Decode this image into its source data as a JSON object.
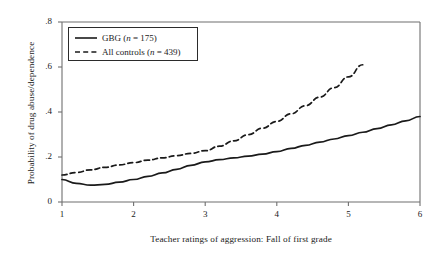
{
  "chart_data": {
    "type": "line",
    "title": "",
    "xlabel": "Teacher ratings of aggression: Fall of first grade",
    "ylabel": "Probability of drug abuse/dependence",
    "xlim": [
      1,
      6
    ],
    "ylim": [
      0,
      0.8
    ],
    "xticks": [
      "1",
      "2",
      "3",
      "4",
      "5",
      "6"
    ],
    "xtick_values": [
      1,
      2,
      3,
      4,
      5,
      6
    ],
    "yticks": [
      "0",
      ".2",
      ".4",
      ".6",
      ".8"
    ],
    "ytick_values": [
      0,
      0.2,
      0.4,
      0.6,
      0.8
    ],
    "grid": false,
    "legend_position": "upper-left",
    "series": [
      {
        "name": "GBG (n = 175)",
        "label_prefix": "GBG (",
        "label_italic": "n",
        "label_suffix": " = 175)",
        "style": "solid",
        "color": "#1a1a1a",
        "x": [
          1.0,
          1.2,
          1.4,
          1.6,
          1.8,
          2.0,
          2.2,
          2.4,
          2.6,
          2.8,
          3.0,
          3.2,
          3.4,
          3.6,
          3.8,
          4.0,
          4.2,
          4.4,
          4.6,
          4.8,
          5.0,
          5.2,
          5.4,
          5.6,
          5.8,
          6.0
        ],
        "y": [
          0.1,
          0.083,
          0.075,
          0.078,
          0.088,
          0.1,
          0.114,
          0.129,
          0.145,
          0.163,
          0.178,
          0.188,
          0.196,
          0.204,
          0.213,
          0.224,
          0.238,
          0.252,
          0.266,
          0.28,
          0.295,
          0.31,
          0.326,
          0.343,
          0.361,
          0.38
        ]
      },
      {
        "name": "All controls (n = 439)",
        "label_prefix": "All controls (",
        "label_italic": "n",
        "label_suffix": " = 439)",
        "style": "dashed",
        "color": "#1a1a1a",
        "x": [
          1.0,
          1.2,
          1.4,
          1.6,
          1.8,
          2.0,
          2.2,
          2.4,
          2.6,
          2.8,
          3.0,
          3.2,
          3.4,
          3.6,
          3.8,
          4.0,
          4.2,
          4.4,
          4.6,
          4.8,
          5.0,
          5.2
        ],
        "y": [
          0.12,
          0.131,
          0.143,
          0.154,
          0.165,
          0.175,
          0.186,
          0.196,
          0.206,
          0.216,
          0.228,
          0.248,
          0.272,
          0.299,
          0.328,
          0.358,
          0.392,
          0.428,
          0.466,
          0.508,
          0.556,
          0.61
        ]
      }
    ]
  },
  "legend": {
    "entries": [
      {
        "swatch": "solid-line-swatch",
        "prefix": "GBG (",
        "italic": "n",
        "suffix": " = 175)"
      },
      {
        "swatch": "dashed-line-swatch",
        "prefix": "All controls (",
        "italic": "n",
        "suffix": " = 439)"
      }
    ]
  },
  "colors": {
    "line": "#1a1a1a",
    "axis": "#6f6f6f",
    "background": "#ffffff",
    "legend_border": "#2b2b2b"
  }
}
